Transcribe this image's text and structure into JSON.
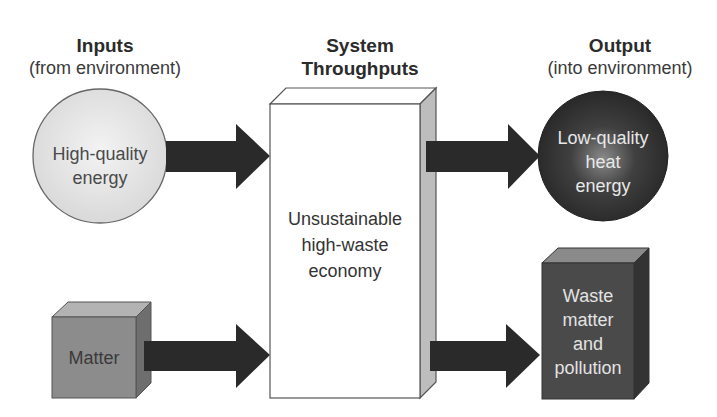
{
  "diagram": {
    "columns": {
      "inputs": {
        "title": "Inputs",
        "subtitle": "(from environment)"
      },
      "system": {
        "title_line1": "System",
        "title_line2": "Throughputs"
      },
      "output": {
        "title": "Output",
        "subtitle": "(into environment)"
      }
    },
    "nodes": {
      "high_quality_energy": {
        "line1": "High-quality",
        "line2": "energy",
        "shape": "circle",
        "fill": "#e4e4e4"
      },
      "matter": {
        "label": "Matter",
        "shape": "cube",
        "fill": "#8a8a8a"
      },
      "economy": {
        "line1": "Unsustainable",
        "line2": "high-waste",
        "line3": "economy",
        "shape": "box",
        "fill": "#ffffff"
      },
      "low_quality_heat": {
        "line1": "Low-quality",
        "line2": "heat",
        "line3": "energy",
        "shape": "circle",
        "fill": "#3a3a3a"
      },
      "waste": {
        "line1": "Waste",
        "line2": "matter",
        "line3": "and",
        "line4": "pollution",
        "shape": "cube",
        "fill": "#474747"
      }
    },
    "edges": [
      {
        "from": "high_quality_energy",
        "to": "economy"
      },
      {
        "from": "matter",
        "to": "economy"
      },
      {
        "from": "economy",
        "to": "low_quality_heat"
      },
      {
        "from": "economy",
        "to": "waste"
      }
    ],
    "colors": {
      "arrow": "#2a2a2a",
      "outline": "#555555",
      "text_dark": "#333333",
      "text_light": "#e8e8e8"
    }
  }
}
